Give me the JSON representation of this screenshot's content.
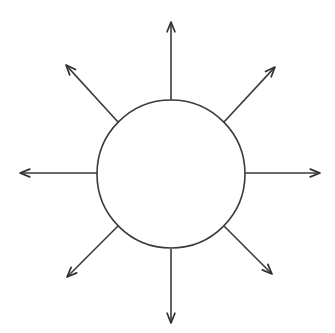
{
  "canvas": {
    "width": 335,
    "height": 333,
    "background_color": "#ffffff",
    "title": "Radial arrow diagram"
  },
  "style": {
    "line_color": "#3a3a3c",
    "arrowhead_color": "#2f2f31",
    "circle_fill": "#ffffff",
    "line_width": 1.6
  },
  "hub": {
    "shape": "circle",
    "center_x": 171,
    "center_y": 174,
    "radius": 74,
    "label": ""
  },
  "chart_data": {
    "type": "diagram",
    "subtitle": "",
    "xlabel": "",
    "ylabel": "",
    "center_shape": "circle",
    "center_label": "",
    "ray_count": 8,
    "angle_step_degrees": 45,
    "rays": [
      {
        "name": "ray-north",
        "direction": "up",
        "angle_degrees": 90,
        "start_x": 171,
        "start_y": 100,
        "end_x": 171,
        "end_y": 22,
        "label": ""
      },
      {
        "name": "ray-northeast",
        "direction": "up-right",
        "angle_degrees": 45,
        "start_x": 224,
        "start_y": 122,
        "end_x": 275,
        "end_y": 67,
        "label": ""
      },
      {
        "name": "ray-east",
        "direction": "right",
        "angle_degrees": 0,
        "start_x": 245,
        "start_y": 173,
        "end_x": 320,
        "end_y": 173,
        "label": ""
      },
      {
        "name": "ray-southeast",
        "direction": "down-right",
        "angle_degrees": -45,
        "start_x": 224,
        "start_y": 226,
        "end_x": 272,
        "end_y": 274,
        "label": ""
      },
      {
        "name": "ray-south",
        "direction": "down",
        "angle_degrees": -90,
        "start_x": 171,
        "start_y": 249,
        "end_x": 171,
        "end_y": 323,
        "label": ""
      },
      {
        "name": "ray-southwest",
        "direction": "down-left",
        "angle_degrees": -135,
        "start_x": 118,
        "start_y": 226,
        "end_x": 67,
        "end_y": 277,
        "label": ""
      },
      {
        "name": "ray-west",
        "direction": "left",
        "angle_degrees": 180,
        "start_x": 97,
        "start_y": 173,
        "end_x": 20,
        "end_y": 173,
        "label": ""
      },
      {
        "name": "ray-northwest",
        "direction": "up-left",
        "angle_degrees": 135,
        "start_x": 118,
        "start_y": 122,
        "end_x": 66,
        "end_y": 65,
        "label": ""
      }
    ],
    "legend": [],
    "annotations": [],
    "grid": false
  }
}
